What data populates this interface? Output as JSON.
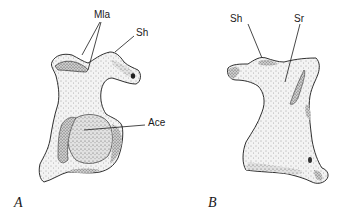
{
  "figure": {
    "panels": [
      {
        "id": "A",
        "letter": "A",
        "labels": {
          "mla": "Mla",
          "sh": "Sh",
          "ace": "Ace"
        }
      },
      {
        "id": "B",
        "letter": "B",
        "labels": {
          "sh": "Sh",
          "sr": "Sr"
        }
      }
    ],
    "colors": {
      "ink": "#1a1a1a",
      "stipple_light": "#e6e6e6",
      "stipple_mid": "#c4c4c4",
      "stipple_dark": "#8a8a8a"
    }
  }
}
